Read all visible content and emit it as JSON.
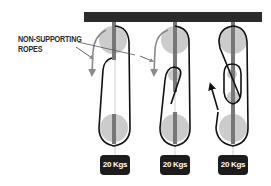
{
  "diagram": {
    "annotation": {
      "line1": "NON-SUPPORTING",
      "line2": "ROPES"
    },
    "systems": [
      {
        "id": "system-1",
        "weight_label": "20 Kgs",
        "description": "single movable pulley, rope returns down (2:1)"
      },
      {
        "id": "system-2",
        "weight_label": "20 Kgs",
        "description": "pulley with rope looping back up (3:1)"
      },
      {
        "id": "system-3",
        "weight_label": "20 Kgs",
        "description": "compound pulley system with pull arrow upward (4:1)"
      }
    ],
    "colors": {
      "beam": "#2b2b2b",
      "rope": "#111111",
      "pulley": "#cccccc",
      "axle": "#777777",
      "arrow_gray": "#8a8a8a",
      "weight_box": "#1c1c1c",
      "weight_text": "#ffffff"
    }
  }
}
